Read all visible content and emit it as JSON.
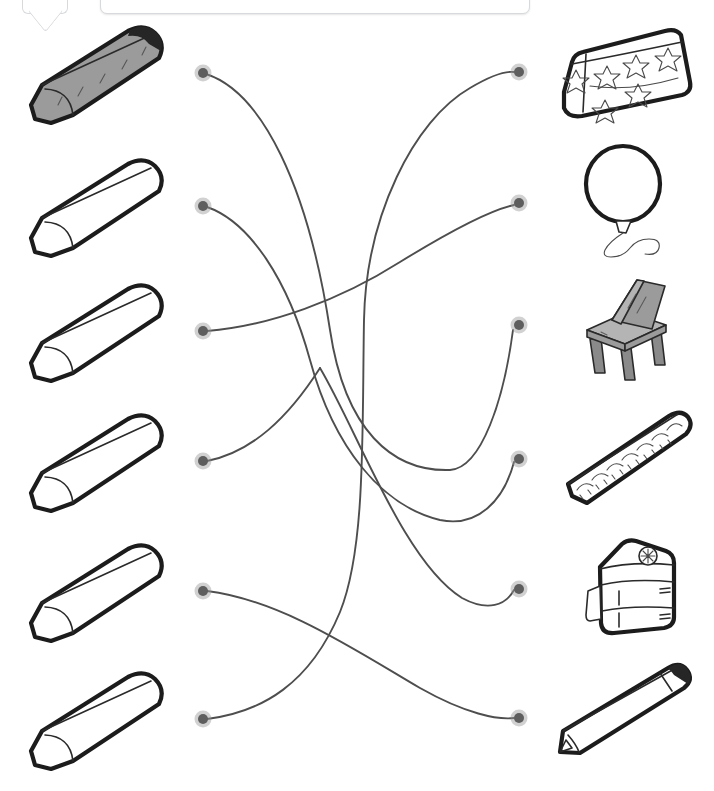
{
  "page": {
    "kind": "matching-worksheet",
    "background_color": "#ffffff",
    "width": 714,
    "height": 791,
    "ink_color": "#1c1c1c",
    "link_color": "#4e4e4e",
    "node_color": "#5e5e5e",
    "shade_color": "#9b9b9b"
  },
  "popup": {
    "name": "tooltip-bar",
    "text": "",
    "visible": true,
    "clipped_top": true
  },
  "left_column": {
    "label": "crayons",
    "items": [
      {
        "index": 1,
        "icon": "crayon-icon",
        "label": "",
        "filled": true,
        "fill_color": "#9b9b9b",
        "y": 73,
        "node_x": 203,
        "node_y": 73
      },
      {
        "index": 2,
        "icon": "crayon-icon",
        "label": "",
        "filled": false,
        "fill_color": "#ffffff",
        "y": 206,
        "node_x": 203,
        "node_y": 206
      },
      {
        "index": 3,
        "icon": "crayon-icon",
        "label": "",
        "filled": false,
        "fill_color": "#ffffff",
        "y": 331,
        "node_x": 203,
        "node_y": 331
      },
      {
        "index": 4,
        "icon": "crayon-icon",
        "label": "",
        "filled": false,
        "fill_color": "#ffffff",
        "y": 461,
        "node_x": 203,
        "node_y": 461
      },
      {
        "index": 5,
        "icon": "crayon-icon",
        "label": "",
        "filled": false,
        "fill_color": "#ffffff",
        "y": 591,
        "node_x": 203,
        "node_y": 591
      },
      {
        "index": 6,
        "icon": "crayon-icon",
        "label": "",
        "filled": false,
        "fill_color": "#ffffff",
        "y": 719,
        "node_x": 203,
        "node_y": 719
      }
    ]
  },
  "right_column": {
    "label": "objects",
    "items": [
      {
        "index": 1,
        "icon": "pencil-case-icon",
        "label": "",
        "filled": false,
        "y": 72,
        "node_x": 519,
        "node_y": 72
      },
      {
        "index": 2,
        "icon": "balloon-icon",
        "label": "",
        "filled": false,
        "y": 203,
        "node_x": 519,
        "node_y": 203
      },
      {
        "index": 3,
        "icon": "chair-icon",
        "label": "",
        "filled": true,
        "y": 325,
        "node_x": 519,
        "node_y": 325
      },
      {
        "index": 4,
        "icon": "ruler-icon",
        "label": "",
        "filled": false,
        "y": 459,
        "node_x": 519,
        "node_y": 459
      },
      {
        "index": 5,
        "icon": "backpack-icon",
        "label": "",
        "filled": false,
        "y": 589,
        "node_x": 519,
        "node_y": 589
      },
      {
        "index": 6,
        "icon": "pencil-icon",
        "label": "",
        "filled": false,
        "y": 718,
        "node_x": 519,
        "node_y": 718
      }
    ]
  },
  "connections": [
    {
      "from": 1,
      "to": 3,
      "label": "crayon-1-to-chair"
    },
    {
      "from": 2,
      "to": 4,
      "label": "crayon-2-to-ruler"
    },
    {
      "from": 3,
      "to": 2,
      "label": "crayon-3-to-balloon"
    },
    {
      "from": 4,
      "to": 5,
      "label": "crayon-4-to-backpack"
    },
    {
      "from": 5,
      "to": 6,
      "label": "crayon-5-to-pencil"
    },
    {
      "from": 6,
      "to": 1,
      "label": "crayon-6-to-pencil-case"
    }
  ],
  "node_counts": {
    "left": 6,
    "right": 6,
    "drawn_links": 6
  }
}
